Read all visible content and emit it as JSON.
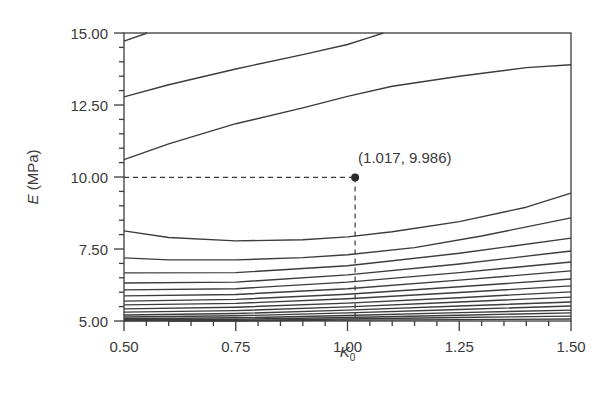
{
  "chart_data": {
    "type": "line",
    "subtype": "contour",
    "title": "",
    "xlabel": "K",
    "xlabel_subscript": "0",
    "ylabel_var": "E",
    "ylabel_unit": " (MPa)",
    "xlim": [
      0.5,
      1.5
    ],
    "ylim": [
      5.0,
      15.0
    ],
    "x_ticks": [
      0.5,
      0.75,
      1.0,
      1.25,
      1.5
    ],
    "x_tick_labels": [
      "0.50",
      "0.75",
      "1.00",
      "1.25",
      "1.50"
    ],
    "x_minor_step": 0.05,
    "y_ticks": [
      5.0,
      7.5,
      10.0,
      12.5,
      15.0
    ],
    "y_tick_labels": [
      "5.00",
      "7.50",
      "10.00",
      "12.50",
      "15.00"
    ],
    "y_minor_step": 0.5,
    "grid": false,
    "legend": null,
    "marked_point": {
      "x": 1.017,
      "y": 9.986,
      "label": "(1.017, 9.986)"
    },
    "line_color": "#3c3c3c",
    "contours": [
      {
        "points": [
          [
            0.5,
            14.72
          ],
          [
            0.552,
            15.0
          ]
        ]
      },
      {
        "points": [
          [
            0.5,
            12.78
          ],
          [
            0.6,
            13.2
          ],
          [
            0.75,
            13.75
          ],
          [
            0.9,
            14.25
          ],
          [
            1.0,
            14.6
          ],
          [
            1.05,
            14.85
          ],
          [
            1.08,
            15.0
          ]
        ]
      },
      {
        "points": [
          [
            0.5,
            10.6
          ],
          [
            0.6,
            11.15
          ],
          [
            0.75,
            11.85
          ],
          [
            0.9,
            12.4
          ],
          [
            1.0,
            12.8
          ],
          [
            1.1,
            13.15
          ],
          [
            1.25,
            13.5
          ],
          [
            1.4,
            13.8
          ],
          [
            1.5,
            13.9
          ]
        ]
      },
      {
        "points": [
          [
            0.5,
            8.13
          ],
          [
            0.6,
            7.9
          ],
          [
            0.75,
            7.78
          ],
          [
            0.9,
            7.82
          ],
          [
            1.0,
            7.92
          ],
          [
            1.1,
            8.1
          ],
          [
            1.25,
            8.45
          ],
          [
            1.4,
            8.95
          ],
          [
            1.5,
            9.44
          ]
        ]
      },
      {
        "points": [
          [
            0.5,
            7.19
          ],
          [
            0.6,
            7.12
          ],
          [
            0.75,
            7.12
          ],
          [
            0.9,
            7.2
          ],
          [
            1.0,
            7.3
          ],
          [
            1.15,
            7.55
          ],
          [
            1.3,
            7.95
          ],
          [
            1.5,
            8.58
          ]
        ]
      },
      {
        "points": [
          [
            0.5,
            6.67
          ],
          [
            0.75,
            6.68
          ],
          [
            1.0,
            6.92
          ],
          [
            1.25,
            7.35
          ],
          [
            1.5,
            7.88
          ]
        ]
      },
      {
        "points": [
          [
            0.5,
            6.32
          ],
          [
            0.75,
            6.35
          ],
          [
            1.0,
            6.6
          ],
          [
            1.25,
            6.98
          ],
          [
            1.5,
            7.43
          ]
        ]
      },
      {
        "points": [
          [
            0.5,
            6.08
          ],
          [
            0.75,
            6.12
          ],
          [
            1.0,
            6.35
          ],
          [
            1.25,
            6.68
          ],
          [
            1.5,
            7.05
          ]
        ]
      },
      {
        "points": [
          [
            0.5,
            5.87
          ],
          [
            0.75,
            5.92
          ],
          [
            1.0,
            6.12
          ],
          [
            1.25,
            6.42
          ],
          [
            1.5,
            6.74
          ]
        ]
      },
      {
        "points": [
          [
            0.5,
            5.69
          ],
          [
            0.75,
            5.75
          ],
          [
            1.0,
            5.93
          ],
          [
            1.25,
            6.19
          ],
          [
            1.5,
            6.46
          ]
        ]
      },
      {
        "points": [
          [
            0.5,
            5.56
          ],
          [
            0.75,
            5.61
          ],
          [
            1.0,
            5.77
          ],
          [
            1.25,
            5.99
          ],
          [
            1.5,
            6.22
          ]
        ]
      },
      {
        "points": [
          [
            0.5,
            5.42
          ],
          [
            0.75,
            5.48
          ],
          [
            1.0,
            5.62
          ],
          [
            1.25,
            5.81
          ],
          [
            1.5,
            6.01
          ]
        ]
      },
      {
        "points": [
          [
            0.5,
            5.31
          ],
          [
            0.75,
            5.36
          ],
          [
            1.0,
            5.49
          ],
          [
            1.25,
            5.66
          ],
          [
            1.5,
            5.83
          ]
        ]
      },
      {
        "points": [
          [
            0.5,
            5.21
          ],
          [
            0.75,
            5.26
          ],
          [
            1.0,
            5.38
          ],
          [
            1.25,
            5.52
          ],
          [
            1.5,
            5.66
          ]
        ]
      },
      {
        "points": [
          [
            0.5,
            5.14
          ],
          [
            0.75,
            5.18
          ],
          [
            1.0,
            5.28
          ],
          [
            1.25,
            5.4
          ],
          [
            1.5,
            5.52
          ]
        ]
      },
      {
        "points": [
          [
            0.5,
            5.08
          ],
          [
            0.75,
            5.11
          ],
          [
            1.0,
            5.19
          ],
          [
            1.25,
            5.29
          ],
          [
            1.5,
            5.38
          ]
        ]
      },
      {
        "points": [
          [
            0.5,
            5.04
          ],
          [
            0.75,
            5.06
          ],
          [
            1.0,
            5.12
          ],
          [
            1.25,
            5.2
          ],
          [
            1.5,
            5.28
          ]
        ]
      },
      {
        "points": [
          [
            0.5,
            5.01
          ],
          [
            0.75,
            5.02
          ],
          [
            1.0,
            5.07
          ],
          [
            1.25,
            5.12
          ],
          [
            1.5,
            5.17
          ]
        ]
      },
      {
        "points": [
          [
            0.6,
            5.0
          ],
          [
            0.75,
            5.0
          ],
          [
            1.0,
            5.03
          ],
          [
            1.25,
            5.05
          ],
          [
            1.5,
            5.07
          ]
        ]
      }
    ]
  }
}
